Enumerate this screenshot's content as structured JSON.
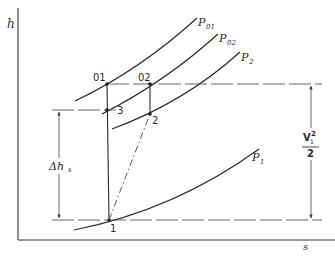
{
  "diagram": {
    "type": "h-s diagram (Mollier) for nozzle/turbine expansion",
    "axes": {
      "y_label": "h",
      "x_label": "s"
    },
    "isobars": [
      {
        "id": "P01",
        "label_main": "P",
        "label_sub": "01"
      },
      {
        "id": "P02",
        "label_main": "P",
        "label_sub": "02"
      },
      {
        "id": "P2",
        "label_main": "P",
        "label_sub": "2"
      },
      {
        "id": "P1",
        "label_main": "P",
        "label_sub": "1"
      }
    ],
    "states": {
      "s01": "01",
      "s02": "02",
      "s3": "3",
      "s2": "2",
      "s1": "1"
    },
    "dimensions": {
      "delta_hs_main": "Δh",
      "delta_hs_sub": "s",
      "kinetic_num_main": "V",
      "kinetic_num_sub": "1",
      "kinetic_num_sup": "2",
      "kinetic_den": "2"
    }
  }
}
